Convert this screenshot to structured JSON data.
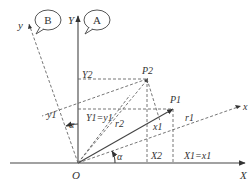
{
  "diagram": {
    "type": "coordinate-rotation",
    "origin_label": "O",
    "axes": {
      "fixed_x": "X",
      "fixed_y": "Y",
      "rotated_x": "x",
      "rotated_y": "y"
    },
    "callouts": {
      "a": "A",
      "b": "B"
    },
    "points": {
      "p1": "P1",
      "p2": "P2"
    },
    "vectors": {
      "r1": "r1",
      "r2": "r2"
    },
    "labels": {
      "Y2": "Y2",
      "y1": "y1",
      "Y1_eq_y1": "Y1=y1",
      "x1": "x1",
      "X2": "X2",
      "X1_eq_x1": "X1=x1",
      "alpha_top": "α",
      "alpha_bottom": "α"
    }
  }
}
